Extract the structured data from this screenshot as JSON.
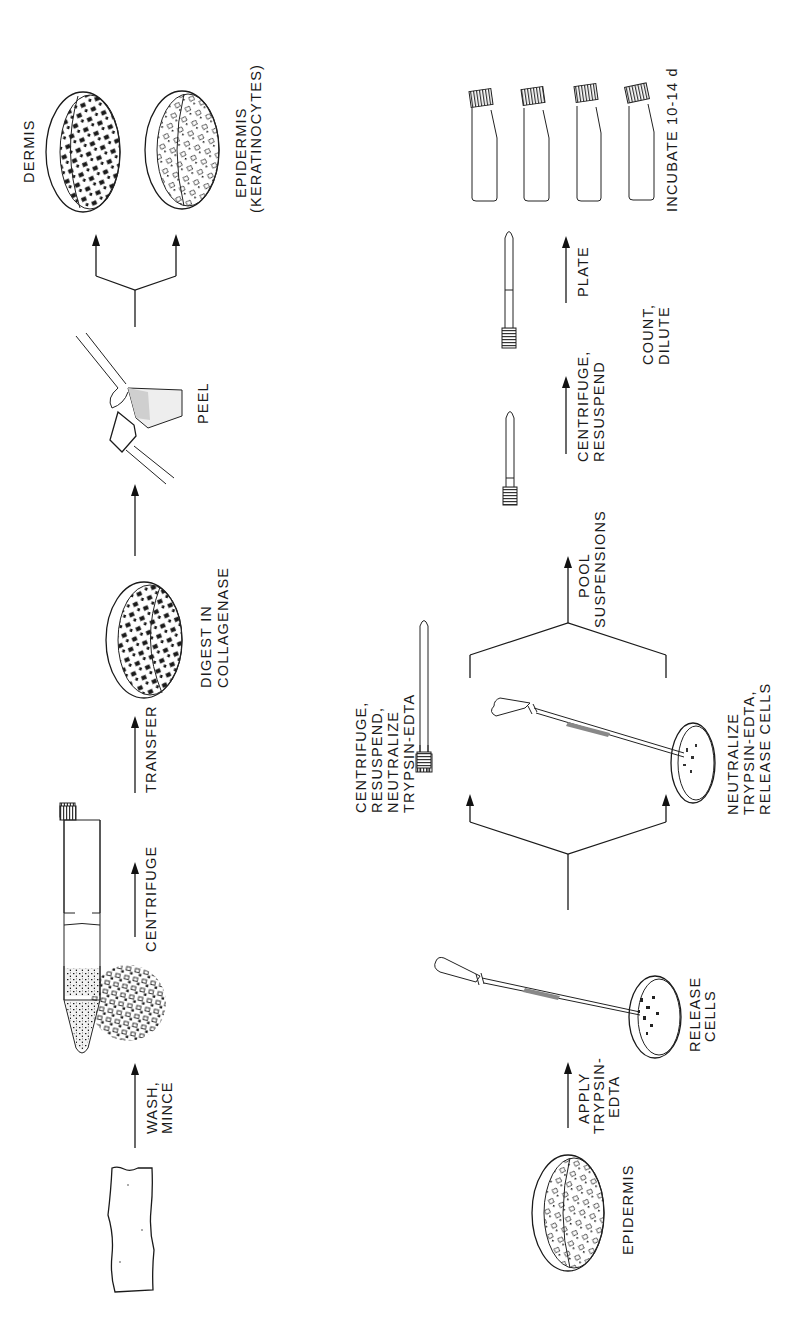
{
  "diagram": {
    "orientation": "rotated 90 degrees counter-clockwise (flow reads bottom to top)",
    "top_row": {
      "steps": [
        {
          "id": "skin",
          "item": "skin-sample",
          "label": ""
        },
        {
          "id": "wash",
          "arrow_label_1": "WASH,",
          "arrow_label_2": "MINCE"
        },
        {
          "id": "minced",
          "item": "minced-tissue",
          "label": ""
        },
        {
          "id": "centrifuge",
          "arrow_label": "CENTRIFUGE"
        },
        {
          "id": "tube",
          "item": "centrifuge-tube-with-pellet",
          "label": ""
        },
        {
          "id": "transfer",
          "arrow_label": "TRANSFER"
        },
        {
          "id": "digest",
          "item": "petri-dish",
          "label_1": "DIGEST IN",
          "label_2": "COLLAGENASE"
        },
        {
          "id": "peel",
          "item": "forceps-peeling",
          "label": "PEEL"
        },
        {
          "id": "dermis",
          "item": "petri-dish-dermis",
          "label": "DERMIS"
        },
        {
          "id": "epidermis",
          "item": "petri-dish-epidermis",
          "label_1": "EPIDERMIS",
          "label_2": "(KERATINOCYTES)"
        }
      ]
    },
    "bottom_row": {
      "steps": [
        {
          "id": "epidermis2",
          "item": "petri-dish-epidermis",
          "label": "EPIDERMIS"
        },
        {
          "id": "apply",
          "arrow_label_1": "APPLY",
          "arrow_label_2": "TRYPSIN-",
          "arrow_label_3": "EDTA"
        },
        {
          "id": "release",
          "item": "pipette-and-dish",
          "label_1": "RELEASE",
          "label_2": "CELLS"
        },
        {
          "id": "branch_a",
          "item": "centrifuge-tube",
          "label_1": "CENTRIFUGE,",
          "label_2": "RESUSPEND,",
          "label_3": "NEUTRALIZE",
          "label_4": "TRYPSIN-EDTA"
        },
        {
          "id": "branch_b",
          "item": "pipette-and-dish",
          "label_1": "NEUTRALIZE",
          "label_2": "TRYPSIN-EDTA,",
          "label_3": "RELEASE CELLS"
        },
        {
          "id": "pool",
          "arrow_label_1": "POOL",
          "arrow_label_2": "SUSPENSIONS"
        },
        {
          "id": "pooled_tube",
          "item": "centrifuge-tube",
          "label": ""
        },
        {
          "id": "centrifuge2",
          "arrow_label_1": "CENTRIFUGE,",
          "arrow_label_2": "RESUSPEND"
        },
        {
          "id": "count",
          "item": "centrifuge-tube",
          "label_1": "COUNT,",
          "label_2": "DILUTE"
        },
        {
          "id": "plate",
          "arrow_label": "PLATE"
        },
        {
          "id": "flasks",
          "item": "culture-flasks",
          "count": 4,
          "label": "INCUBATE 10-14 d"
        }
      ]
    },
    "colors": {
      "ink": "#1a1a1a",
      "background": "#ffffff"
    }
  }
}
